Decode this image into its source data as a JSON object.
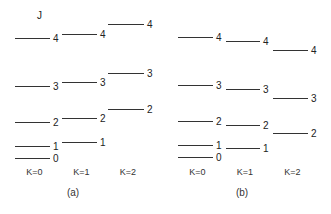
{
  "j_axis_label": "J",
  "panels": [
    {
      "caption": "(a)",
      "columns": [
        {
          "k_label": "K=0",
          "x1": 15,
          "x2": 50,
          "levels": [
            {
              "j": "4",
              "y": 38
            },
            {
              "j": "3",
              "y": 86
            },
            {
              "j": "2",
              "y": 122
            },
            {
              "j": "1",
              "y": 146
            },
            {
              "j": "0",
              "y": 158
            }
          ]
        },
        {
          "k_label": "K=1",
          "x1": 62,
          "x2": 97,
          "levels": [
            {
              "j": "4",
              "y": 34
            },
            {
              "j": "3",
              "y": 82
            },
            {
              "j": "2",
              "y": 118
            },
            {
              "j": "1",
              "y": 142
            }
          ]
        },
        {
          "k_label": "K=2",
          "x1": 108,
          "x2": 144,
          "levels": [
            {
              "j": "4",
              "y": 24
            },
            {
              "j": "3",
              "y": 73
            },
            {
              "j": "2",
              "y": 109
            }
          ]
        }
      ],
      "caption_x": 73,
      "caption_y": 196
    },
    {
      "caption": "(b)",
      "columns": [
        {
          "k_label": "K=0",
          "x1": 178,
          "x2": 213,
          "levels": [
            {
              "j": "4",
              "y": 37
            },
            {
              "j": "3",
              "y": 85
            },
            {
              "j": "2",
              "y": 121
            },
            {
              "j": "1",
              "y": 145
            },
            {
              "j": "0",
              "y": 157
            }
          ]
        },
        {
          "k_label": "K=1",
          "x1": 226,
          "x2": 260,
          "levels": [
            {
              "j": "4",
              "y": 41
            },
            {
              "j": "3",
              "y": 89
            },
            {
              "j": "2",
              "y": 125
            },
            {
              "j": "1",
              "y": 148
            }
          ]
        },
        {
          "k_label": "K=2",
          "x1": 273,
          "x2": 308,
          "levels": [
            {
              "j": "4",
              "y": 50
            },
            {
              "j": "3",
              "y": 98
            },
            {
              "j": "2",
              "y": 133
            }
          ]
        }
      ],
      "caption_x": 242,
      "caption_y": 196
    }
  ]
}
